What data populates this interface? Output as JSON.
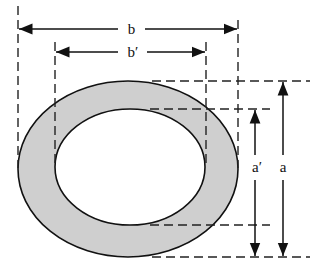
{
  "diagram": {
    "labels": {
      "outer_width": "b",
      "inner_width": "b′",
      "outer_height": "a",
      "inner_height": "a′"
    },
    "colors": {
      "ring_fill": "#cfcfcf",
      "stroke": "#111111",
      "background": "#ffffff"
    },
    "shapes": {
      "outer_ellipse": {
        "cx": 128,
        "cy": 169,
        "rx": 110,
        "ry": 88
      },
      "inner_ellipse": {
        "cx": 130,
        "cy": 167,
        "rx": 75,
        "ry": 58
      }
    }
  }
}
